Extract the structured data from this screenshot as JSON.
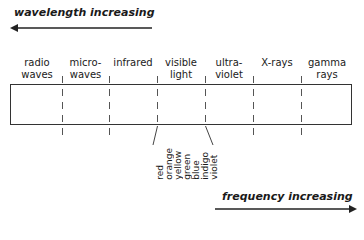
{
  "top_arrow": {
    "label": "wavelength increasing",
    "direction": "left"
  },
  "bottom_arrow": {
    "label": "frequency increasing",
    "direction": "right"
  },
  "bands": [
    {
      "label": "radio\nwaves"
    },
    {
      "label": "micro-\nwaves"
    },
    {
      "label": "infrared"
    },
    {
      "label": "visible\nlight"
    },
    {
      "label": "ultra-\nviolet"
    },
    {
      "label": "X-rays"
    },
    {
      "label": "gamma\nrays"
    }
  ],
  "visible_colors": [
    "red",
    "orange",
    "yellow",
    "green",
    "blue",
    "indigo",
    "violet"
  ],
  "colors": {
    "line": "#333333",
    "text": "#1a1a1a",
    "background": "#ffffff"
  }
}
